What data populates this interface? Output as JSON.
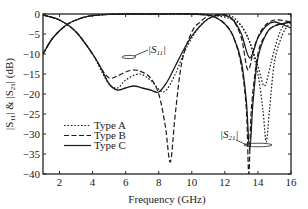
{
  "chart_data": {
    "type": "line",
    "title": "",
    "xlabel": "Frequency (GHz)",
    "ylabel": "|S11| & |S21| (dB)",
    "xlim": [
      1,
      16
    ],
    "ylim": [
      -40,
      0
    ],
    "xticks": [
      2,
      4,
      6,
      8,
      10,
      12,
      14,
      16
    ],
    "yticks": [
      0,
      -5,
      -10,
      -15,
      -20,
      -25,
      -30,
      -35,
      -40
    ],
    "grid": false,
    "legend_position": "lower-left",
    "annotations": [
      {
        "text": "|S11|",
        "x": 5.3,
        "y": -11
      },
      {
        "text": "|S21|",
        "x": 12.6,
        "y": -32
      }
    ],
    "series": [
      {
        "name": "Type A",
        "style": "dotted",
        "quantity": "S11",
        "x": [
          1,
          2,
          3,
          4,
          4.5,
          5,
          5.5,
          6,
          6.8,
          7.5,
          8.3,
          9,
          9.5,
          10,
          10.5,
          11,
          11.5,
          12,
          12.5,
          13,
          13.5,
          14,
          14.4,
          14.8,
          15.2,
          15.6,
          16
        ],
        "y": [
          -0.3,
          -1.5,
          -4.5,
          -10,
          -14,
          -17.5,
          -18.5,
          -16.5,
          -15,
          -16.5,
          -19.5,
          -15,
          -10,
          -6,
          -3,
          -1.2,
          -0.3,
          -0.2,
          -0.8,
          -3,
          -7,
          -13,
          -18,
          -12,
          -6,
          -2.5,
          -2
        ]
      },
      {
        "name": "Type B",
        "style": "dashed",
        "quantity": "S11",
        "x": [
          1,
          2,
          3,
          4,
          4.5,
          5,
          5.5,
          6,
          6.5,
          7,
          7.5,
          8,
          8.4,
          8.7,
          9,
          9.4,
          10,
          10.5,
          11,
          11.5,
          12,
          12.5,
          13,
          13.4,
          13.8,
          14.3,
          15,
          16
        ],
        "y": [
          -0.3,
          -1.5,
          -4.5,
          -10,
          -13.5,
          -16,
          -15.5,
          -14.5,
          -14,
          -14.5,
          -16,
          -20,
          -28,
          -37,
          -25,
          -12,
          -4.5,
          -2,
          -0.5,
          -0.2,
          -0.3,
          -1.5,
          -6,
          -14,
          -8,
          -3.5,
          -1.5,
          -2
        ]
      },
      {
        "name": "Type C",
        "style": "solid",
        "quantity": "S11",
        "x": [
          1,
          2,
          3,
          4,
          4.5,
          5,
          5.5,
          6,
          6.5,
          7,
          7.5,
          8,
          8.5,
          9,
          9.5,
          10,
          10.5,
          11,
          11.5,
          12,
          12.5,
          13,
          13.5,
          14,
          14.5,
          15,
          16
        ],
        "y": [
          -0.3,
          -1.5,
          -4.5,
          -10,
          -13.5,
          -17.5,
          -19,
          -18.5,
          -18,
          -18.5,
          -19,
          -19.5,
          -17,
          -13,
          -9,
          -5.5,
          -3,
          -1.2,
          -0.4,
          -0.3,
          -1.5,
          -5,
          -11,
          -6,
          -3,
          -2,
          -3.5
        ]
      },
      {
        "name": "Type A",
        "style": "dotted",
        "quantity": "S21",
        "x": [
          1,
          1.5,
          2,
          2.5,
          3,
          3.5,
          4,
          5,
          6,
          8,
          10,
          11,
          12,
          12.5,
          13,
          13.5,
          14,
          14.3,
          14.5,
          14.7,
          15,
          15.5,
          16
        ],
        "y": [
          -10,
          -6.5,
          -4.2,
          -2.5,
          -1.5,
          -0.8,
          -0.4,
          -0.1,
          0,
          0,
          0,
          -0.2,
          -0.8,
          -1.5,
          -3,
          -7,
          -15,
          -24,
          -32,
          -24,
          -12,
          -5,
          -2
        ]
      },
      {
        "name": "Type B",
        "style": "dashed",
        "quantity": "S21",
        "x": [
          1,
          1.5,
          2,
          2.5,
          3,
          3.5,
          4,
          5,
          6,
          8,
          10,
          11,
          11.5,
          12,
          12.5,
          13,
          13.3,
          13.45,
          13.6,
          14,
          14.5,
          15,
          16
        ],
        "y": [
          -10,
          -6.5,
          -4.2,
          -2.5,
          -1.5,
          -0.8,
          -0.4,
          -0.1,
          0,
          0,
          0,
          -0.3,
          -1,
          -2.5,
          -5.5,
          -13,
          -24,
          -40,
          -24,
          -10,
          -5,
          -3,
          -2
        ]
      },
      {
        "name": "Type C",
        "style": "solid",
        "quantity": "S21",
        "x": [
          1,
          1.5,
          2,
          2.5,
          3,
          3.5,
          4,
          5,
          6,
          8,
          10,
          11,
          11.5,
          12,
          12.5,
          13,
          13.3,
          13.5,
          13.7,
          14,
          14.5,
          15,
          16
        ],
        "y": [
          -10,
          -6.5,
          -4.2,
          -2.5,
          -1.5,
          -0.8,
          -0.4,
          -0.1,
          0,
          0,
          0,
          -0.3,
          -1,
          -2.5,
          -5.5,
          -12,
          -22,
          -34,
          -22,
          -11,
          -5,
          -3,
          -2
        ]
      }
    ]
  },
  "axes": {
    "xlabel": "Frequency (GHz)",
    "ylabel_parts": [
      "|S",
      "11",
      "| & |S",
      "21",
      "| (dB)"
    ]
  },
  "legend": [
    {
      "label": "Type A",
      "style": "dotted"
    },
    {
      "label": "Type B",
      "style": "dashed"
    },
    {
      "label": "Type C",
      "style": "solid"
    }
  ],
  "annotations": {
    "s11": {
      "base": "|S",
      "sub": "11",
      "end": "|"
    },
    "s21": {
      "base": "|S",
      "sub": "21",
      "end": "|"
    }
  },
  "colors": {
    "line": "#1a1a1a",
    "axis": "#222222"
  }
}
